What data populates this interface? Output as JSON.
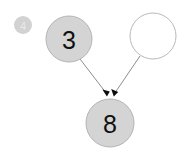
{
  "diagram": {
    "type": "directed-graph",
    "background_color": "#ffffff",
    "edge_color": "#8e8e8e",
    "arrow_color": "#0d0d0d",
    "node_fill_color": "#d4d4d4",
    "node_stroke_color": "#b4b4b4",
    "node_empty_fill_color": "#ffffff",
    "label_color": "#111111",
    "nodes": [
      {
        "id": "node-3",
        "label": "3",
        "cx": 69,
        "cy": 39,
        "r": 23,
        "filled": true
      },
      {
        "id": "node-empty",
        "label": "",
        "cx": 153,
        "cy": 36,
        "r": 23,
        "filled": false
      },
      {
        "id": "node-8",
        "label": "8",
        "cx": 110,
        "cy": 123,
        "r": 24,
        "filled": true
      }
    ],
    "edges": [
      {
        "id": "edge-3-to-8",
        "from": "node-3",
        "to": "node-8",
        "directed": true,
        "x1": 80,
        "y1": 59,
        "x2": 105,
        "y2": 95
      },
      {
        "id": "edge-empty-to-8",
        "from": "node-empty",
        "to": "node-8",
        "directed": true,
        "x1": 140,
        "y1": 56,
        "x2": 116,
        "y2": 95
      }
    ]
  },
  "badge": {
    "label": "4",
    "cx": 23,
    "cy": 25,
    "r": 9,
    "fill_color": "#d2d2d2",
    "text_color": "#e9e9e9"
  }
}
